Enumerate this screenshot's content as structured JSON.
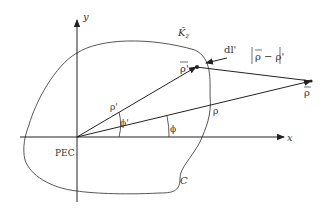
{
  "diagram": {
    "type": "2D scattering geometry (PEC cylinder, line source)",
    "axes": {
      "x_label": "x",
      "y_label": "y"
    },
    "labels": {
      "surface_current": "K̃",
      "surface_current_sub": "z",
      "source_point": "ρ'",
      "observation_point": "ρ",
      "distance": "ρ − ρ'",
      "element": "dl'",
      "source_radius": "ρ'",
      "obs_radius": "ρ",
      "source_angle": "ϕ'",
      "obs_angle": "ϕ",
      "body": "PEC",
      "contour": "C"
    }
  }
}
